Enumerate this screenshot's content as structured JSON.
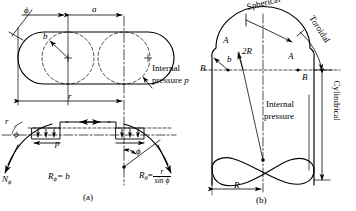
{
  "figure": {
    "title_a": "(a)",
    "title_b": "(b)"
  },
  "panel_a": {
    "name": "toroidal-vessel-plan-and-membrane-section",
    "labels": {
      "phi_top": "ϕ",
      "dim_a": "a",
      "dim_b": "b",
      "dim_r": "r",
      "internal_pressure_line1": "Internal",
      "internal_pressure_line2": "pressure p",
      "pressure_p": "p",
      "n_phi": "N",
      "n_phi_sub": "ϕ",
      "phi_left": "ϕ",
      "phi_center": "ϕ",
      "r_phi_lhs": "R",
      "r_phi_sub": "ϕ",
      "r_phi_eq": "= b",
      "r_theta_lhs": "R",
      "r_theta_sub": "θ",
      "r_theta_eq": "=",
      "r_theta_num": "r",
      "r_theta_den": "sin ϕ"
    }
  },
  "panel_b": {
    "name": "pressure-vessel-cross-section",
    "labels": {
      "spherical": "Spherical",
      "toroidal": "Toroidal",
      "cylindrical": "Cylindrical",
      "A_left": "A",
      "A_right": "A",
      "B_left": "B",
      "B_right": "B",
      "two_R": "2R",
      "b": "b",
      "internal_line1": "Internal",
      "internal_line2": "pressure",
      "dim_R": "R"
    }
  },
  "style": {
    "stroke": "#000000",
    "background": "#ffffff"
  }
}
